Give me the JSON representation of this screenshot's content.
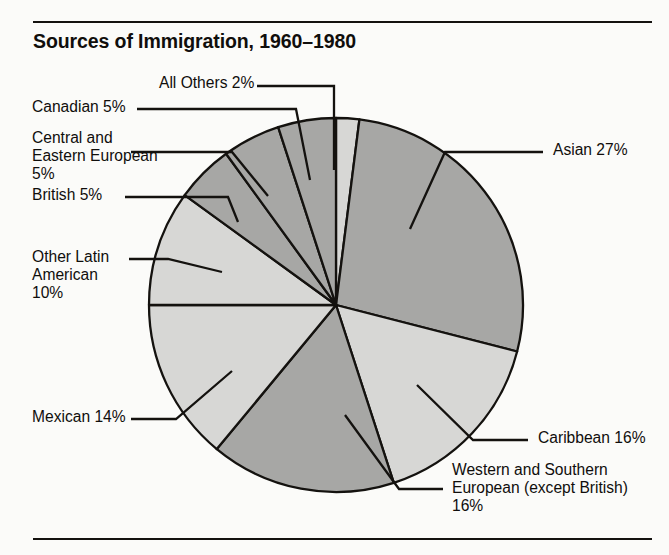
{
  "chart_data": {
    "type": "pie",
    "title": "Sources of Immigration, 1960–1980",
    "xlabel": "",
    "ylabel": "",
    "units": "percent",
    "total": 100,
    "legend": "none",
    "labels_placement": "external with leader lines",
    "categories": [
      "All Others",
      "Asian",
      "Caribbean",
      "Western and Southern European (except British)",
      "Mexican",
      "Other Latin American",
      "British",
      "Central and Eastern European",
      "Canadian"
    ],
    "values": [
      2,
      27,
      16,
      16,
      14,
      10,
      5,
      5,
      5
    ],
    "slices": [
      {
        "name": "All Others",
        "value": 2,
        "label": "All Others 2%",
        "fill": "#d7d7d5",
        "start_deg": 0,
        "end_deg": 7.2
      },
      {
        "name": "Asian",
        "value": 27,
        "label": "Asian 27%",
        "fill": "#a7a7a5",
        "start_deg": 7.2,
        "end_deg": 104.4
      },
      {
        "name": "Caribbean",
        "value": 16,
        "label": "Caribbean 16%",
        "fill": "#d7d7d5",
        "start_deg": 104.4,
        "end_deg": 162.0
      },
      {
        "name": "Western and Southern European (except British)",
        "value": 16,
        "label": "Western and Southern\nEuropean (except British)\n16%",
        "fill": "#a7a7a5",
        "start_deg": 162.0,
        "end_deg": 219.6
      },
      {
        "name": "Mexican",
        "value": 14,
        "label": "Mexican 14%",
        "fill": "#d7d7d5",
        "start_deg": 219.6,
        "end_deg": 270.0
      },
      {
        "name": "Other Latin American",
        "value": 10,
        "label": "Other Latin\nAmerican\n10%",
        "fill": "#d7d7d5",
        "start_deg": 270.0,
        "end_deg": 306.0
      },
      {
        "name": "British",
        "value": 5,
        "label": "British 5%",
        "fill": "#a7a7a5",
        "start_deg": 306.0,
        "end_deg": 324.0
      },
      {
        "name": "Central and Eastern European",
        "value": 5,
        "label": "Central and\nEastern European\n5%",
        "fill": "#a7a7a5",
        "start_deg": 324.0,
        "end_deg": 342.0
      },
      {
        "name": "Canadian",
        "value": 5,
        "label": "Canadian 5%",
        "fill": "#a7a7a5",
        "start_deg": 342.0,
        "end_deg": 360.0
      }
    ],
    "colors": {
      "fill_dark": "#a7a7a5",
      "fill_light": "#d7d7d5",
      "outline": "#14120f",
      "text": "#100e0c",
      "background": "#fbfbf9"
    }
  },
  "labels": {
    "all_others": "All Others 2%",
    "canadian": "Canadian 5%",
    "central_eastern_european": "Central and\nEastern European\n5%",
    "british": "British 5%",
    "other_latin_american": "Other Latin\nAmerican\n10%",
    "mexican": "Mexican 14%",
    "asian": "Asian 27%",
    "caribbean": "Caribbean 16%",
    "western_southern_european": "Western and Southern\nEuropean (except British)\n16%"
  }
}
